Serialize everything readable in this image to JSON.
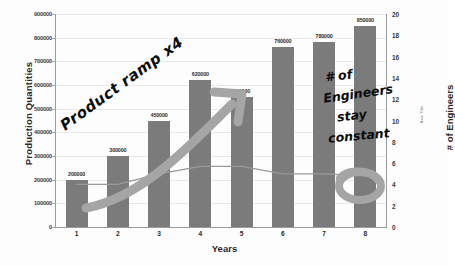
{
  "chart_data": {
    "type": "bar",
    "title": "",
    "xlabel": "Years",
    "ylabel": "Production Quantities",
    "y2label": "# of Engineers",
    "y2_placeholder_label": "Axis Title",
    "categories": [
      "1",
      "2",
      "3",
      "4",
      "5",
      "6",
      "7",
      "8"
    ],
    "ylim": [
      0,
      900000
    ],
    "ytick_labels": [
      "900000",
      "800000",
      "700000",
      "600000",
      "500000",
      "400000",
      "300000",
      "200000",
      "100000",
      "0"
    ],
    "ytick_values": [
      900000,
      800000,
      700000,
      600000,
      500000,
      400000,
      300000,
      200000,
      100000,
      0
    ],
    "y2lim": [
      0,
      20
    ],
    "y2tick_labels": [
      "20",
      "18",
      "16",
      "14",
      "12",
      "10",
      "8",
      "6",
      "4",
      "2",
      "0"
    ],
    "y2tick_values": [
      20,
      18,
      16,
      14,
      12,
      10,
      8,
      6,
      4,
      2,
      0
    ],
    "grid": true,
    "legend": "none",
    "series": [
      {
        "name": "Production Quantities",
        "type": "bar",
        "axis": "left",
        "color": "#7b7b7b",
        "values": [
          200000,
          300000,
          450000,
          620000,
          550000,
          760000,
          780000,
          850000
        ],
        "data_labels": [
          "200000",
          "300000",
          "450000",
          "620000",
          "550000",
          "760000",
          "780000",
          "850000"
        ]
      },
      {
        "name": "# of Engineers",
        "type": "line",
        "axis": "right",
        "color": "#9a9a9a",
        "values": [
          4.0,
          4.0,
          5.0,
          5.7,
          5.7,
          5.0,
          5.0,
          4.8
        ]
      }
    ],
    "annotations": [
      {
        "name": "product-ramp",
        "text": "Product ramp x4",
        "style": "handwritten",
        "color": "#0b0b0b",
        "arrow": true,
        "arrow_color": "#9a9a9a"
      },
      {
        "name": "engineers-constant-line-1",
        "text": "# of",
        "style": "handwritten",
        "color": "#0b0b0b"
      },
      {
        "name": "engineers-constant-line-2",
        "text": "Engineers",
        "style": "handwritten",
        "color": "#0b0b0b"
      },
      {
        "name": "engineers-constant-line-3",
        "text": "stay",
        "style": "handwritten",
        "color": "#0b0b0b"
      },
      {
        "name": "engineers-constant-line-4",
        "text": "constant",
        "style": "handwritten",
        "color": "#0b0b0b"
      },
      {
        "name": "engineers-circle-highlight",
        "text": "",
        "style": "handwritten-circle",
        "color": "#9a9a9a"
      }
    ]
  }
}
